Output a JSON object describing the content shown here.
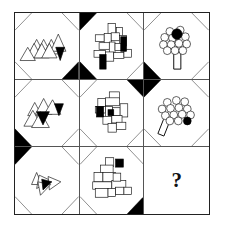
{
  "puzzle": {
    "type": "matrix-reasoning",
    "rows": 3,
    "columns": 3,
    "missing_cell": "row3-col3",
    "question_mark": "?",
    "colors": {
      "ink": "#111111",
      "outline": "#555555",
      "fill_black": "#000000",
      "background": "#ffffff"
    },
    "cells": [
      {
        "id": "row1-col1",
        "shape_kind": "triangles",
        "shape_count": 9,
        "black_shape_count": 1,
        "black_corners": [
          "bottom-right"
        ],
        "description": "cluster of outlined triangles with one solid black triangle"
      },
      {
        "id": "row1-col2",
        "shape_kind": "rectangles",
        "shape_count": 14,
        "black_shape_count": 2,
        "black_corners": [
          "top-left",
          "bottom-left"
        ],
        "description": "cluster of outlined rectangles with two solid black rectangles"
      },
      {
        "id": "row1-col3",
        "shape_kind": "circles",
        "shape_count": 13,
        "black_shape_count": 1,
        "black_corners": [
          "bottom-left"
        ],
        "description": "cluster of outlined circles with one solid black circle, on a stem"
      },
      {
        "id": "row2-col1",
        "shape_kind": "triangles",
        "shape_count": 7,
        "black_shape_count": 2,
        "black_corners": [
          "bottom-left"
        ],
        "description": "cluster of outlined triangles with two solid black triangles"
      },
      {
        "id": "row2-col2",
        "shape_kind": "rectangles",
        "shape_count": 13,
        "black_shape_count": 2,
        "black_corners": [
          "top-right"
        ],
        "description": "cluster of outlined rectangles with two solid black rectangles"
      },
      {
        "id": "row2-col3",
        "shape_kind": "circles",
        "shape_count": 14,
        "black_shape_count": 1,
        "black_corners": [
          "top-left"
        ],
        "description": "cluster of outlined circles with one solid black circle, on a stem"
      },
      {
        "id": "row3-col1",
        "shape_kind": "triangles",
        "shape_count": 5,
        "black_shape_count": 1,
        "black_corners": [
          "top-left"
        ],
        "description": "cluster of outlined triangles with one solid black triangle"
      },
      {
        "id": "row3-col2",
        "shape_kind": "rectangles",
        "shape_count": 12,
        "black_shape_count": 1,
        "black_corners": [
          "bottom-right"
        ],
        "description": "cluster of outlined rectangles with one solid black rectangle"
      },
      {
        "id": "row3-col3",
        "shape_kind": "none",
        "shape_count": 0,
        "black_shape_count": 0,
        "black_corners": [],
        "description": "empty answer cell containing a question mark"
      }
    ]
  }
}
